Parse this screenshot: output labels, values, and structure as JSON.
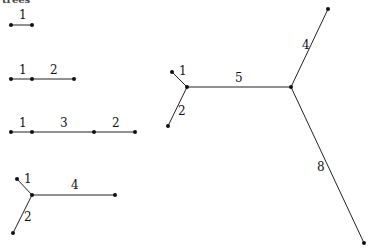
{
  "title_fragment": "trees",
  "diagram": {
    "trees": [
      {
        "id": "tree-1",
        "edges": [
          {
            "weight": "1"
          }
        ]
      },
      {
        "id": "tree-2",
        "edges": [
          {
            "weight": "1"
          },
          {
            "weight": "2"
          }
        ]
      },
      {
        "id": "tree-3",
        "edges": [
          {
            "weight": "1"
          },
          {
            "weight": "3"
          },
          {
            "weight": "2"
          }
        ]
      },
      {
        "id": "tree-4",
        "edges": [
          {
            "weight": "1"
          },
          {
            "weight": "4"
          },
          {
            "weight": "2"
          }
        ]
      },
      {
        "id": "tree-5",
        "edges": [
          {
            "weight": "1"
          },
          {
            "weight": "2"
          },
          {
            "weight": "5"
          },
          {
            "weight": "4"
          },
          {
            "weight": "8"
          }
        ]
      }
    ]
  },
  "colors": {
    "edge": "#222222",
    "node": "#111111",
    "background": "#ffffff"
  }
}
